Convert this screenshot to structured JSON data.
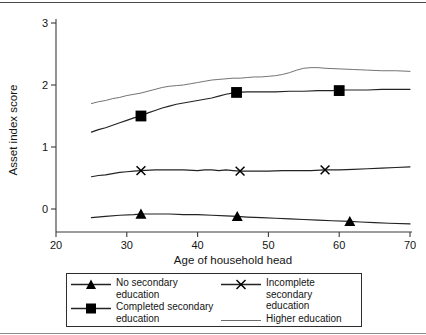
{
  "chart_data": {
    "type": "line",
    "title": "",
    "xlabel": "Age of household head",
    "ylabel": "Asset index score",
    "xlim": [
      20,
      70
    ],
    "ylim": [
      -0.45,
      3.0
    ],
    "xticks": [
      "20",
      "30",
      "40",
      "50",
      "60",
      "70"
    ],
    "xtick_values": [
      20,
      30,
      40,
      50,
      60,
      70
    ],
    "yticks": [
      "0",
      "1",
      "2",
      "3"
    ],
    "ytick_values": [
      0,
      1,
      2,
      3
    ],
    "grid": false,
    "legend_position": "below-axes",
    "series": [
      {
        "name": "No secondary education",
        "marker": "triangle",
        "color": "#232323",
        "x": [
          25,
          27,
          29,
          31,
          32,
          34,
          36,
          38,
          40,
          42,
          44,
          45.6,
          47,
          49,
          51,
          53,
          55,
          57,
          59,
          61.5,
          63,
          65,
          67,
          70
        ],
        "y": [
          -0.14,
          -0.12,
          -0.1,
          -0.09,
          -0.08,
          -0.08,
          -0.08,
          -0.09,
          -0.09,
          -0.1,
          -0.11,
          -0.12,
          -0.13,
          -0.14,
          -0.15,
          -0.16,
          -0.17,
          -0.18,
          -0.19,
          -0.2,
          -0.21,
          -0.22,
          -0.23,
          -0.24
        ],
        "marker_points": [
          {
            "x": 32,
            "y": -0.08
          },
          {
            "x": 45.6,
            "y": -0.12
          },
          {
            "x": 61.5,
            "y": -0.2
          }
        ]
      },
      {
        "name": "Incomplete secondary education",
        "marker": "x",
        "color": "#232323",
        "x": [
          25,
          26,
          27,
          28,
          29,
          30,
          31,
          32,
          34,
          36,
          38,
          40,
          41,
          42,
          43,
          44,
          45,
          46,
          48,
          50,
          52,
          54,
          56,
          58,
          60,
          62,
          64,
          66,
          68,
          70
        ],
        "y": [
          0.52,
          0.54,
          0.55,
          0.57,
          0.59,
          0.6,
          0.61,
          0.62,
          0.63,
          0.63,
          0.63,
          0.62,
          0.63,
          0.63,
          0.62,
          0.63,
          0.62,
          0.61,
          0.61,
          0.61,
          0.62,
          0.62,
          0.62,
          0.63,
          0.63,
          0.64,
          0.65,
          0.66,
          0.67,
          0.68
        ],
        "marker_points": [
          {
            "x": 32,
            "y": 0.62
          },
          {
            "x": 46,
            "y": 0.61
          },
          {
            "x": 58,
            "y": 0.63
          }
        ]
      },
      {
        "name": "Completed secondary education",
        "marker": "square",
        "color": "#232323",
        "x": [
          25,
          26,
          27,
          28,
          29,
          30,
          31,
          32,
          33,
          34,
          35,
          36,
          37,
          38,
          39,
          40,
          41,
          42,
          43,
          44,
          45.5,
          47,
          49,
          51,
          53,
          55,
          57,
          59,
          60,
          62,
          64,
          66,
          68,
          70
        ],
        "y": [
          1.24,
          1.28,
          1.31,
          1.35,
          1.39,
          1.43,
          1.47,
          1.5,
          1.55,
          1.59,
          1.63,
          1.66,
          1.69,
          1.71,
          1.73,
          1.75,
          1.77,
          1.79,
          1.82,
          1.85,
          1.88,
          1.89,
          1.89,
          1.89,
          1.9,
          1.9,
          1.91,
          1.91,
          1.92,
          1.92,
          1.92,
          1.93,
          1.93,
          1.93
        ],
        "marker_points": [
          {
            "x": 32,
            "y": 1.5
          },
          {
            "x": 45.5,
            "y": 1.88
          },
          {
            "x": 60,
            "y": 1.91
          }
        ]
      },
      {
        "name": "Higher education",
        "marker": "none",
        "color": "#6b6b6b",
        "x": [
          25,
          26,
          27,
          28,
          29,
          30,
          31,
          32,
          33,
          34,
          35,
          36,
          37,
          38,
          39,
          40,
          41,
          42,
          43,
          44,
          45,
          46,
          47,
          48,
          49,
          50,
          51,
          52,
          53,
          54,
          55,
          56,
          57,
          58,
          60,
          62,
          64,
          66,
          68,
          70
        ],
        "y": [
          1.7,
          1.73,
          1.75,
          1.78,
          1.8,
          1.83,
          1.85,
          1.87,
          1.9,
          1.93,
          1.96,
          1.98,
          1.99,
          2.0,
          2.02,
          2.04,
          2.06,
          2.08,
          2.09,
          2.1,
          2.11,
          2.11,
          2.12,
          2.13,
          2.13,
          2.14,
          2.15,
          2.17,
          2.2,
          2.24,
          2.27,
          2.28,
          2.28,
          2.27,
          2.26,
          2.25,
          2.24,
          2.23,
          2.23,
          2.22
        ]
      }
    ]
  },
  "axes": {
    "y_title": "Asset index score",
    "x_title": "Age of household head"
  },
  "legend": {
    "entries": [
      {
        "label": "No secondary education",
        "marker": "triangle",
        "column": 0
      },
      {
        "label": "Completed secondary\neducation",
        "marker": "square",
        "column": 0
      },
      {
        "label": "Incomplete secondary\neducation",
        "marker": "x",
        "column": 1
      },
      {
        "label": "Higher education",
        "marker": "line",
        "column": 1
      }
    ]
  }
}
